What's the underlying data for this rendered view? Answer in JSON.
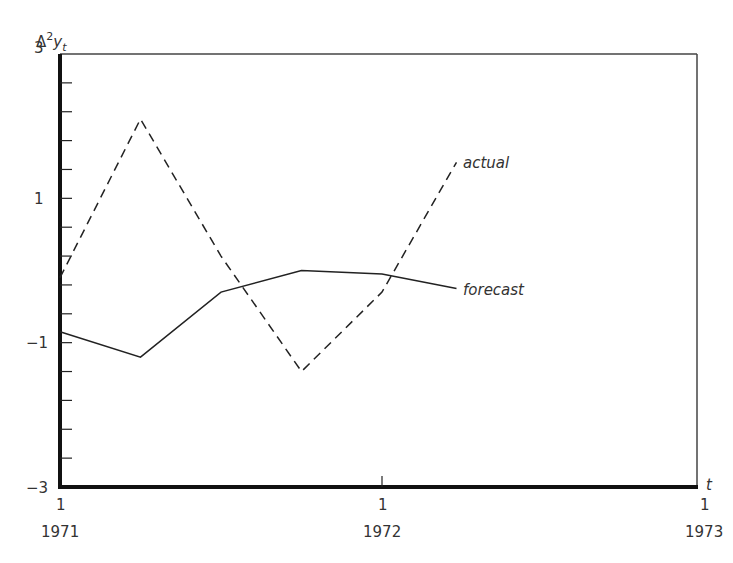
{
  "chart_data": {
    "type": "line",
    "title": "",
    "ylabel": "Δ²y_t",
    "xlabel": "t",
    "ylim": [
      -3,
      3
    ],
    "yticks_labeled": [
      "3",
      "1",
      "−1",
      "−3"
    ],
    "x_ticks": [
      {
        "quarter": "1",
        "year": "1971"
      },
      {
        "quarter": "1",
        "year": "1972"
      },
      {
        "quarter": "1",
        "year": "1973"
      }
    ],
    "x": [
      "1971Q1",
      "1971Q2",
      "1971Q3",
      "1971Q4",
      "1972Q1",
      "1972Q2"
    ],
    "series": [
      {
        "name": "actual",
        "style": "dashed",
        "values": [
          -0.1,
          2.1,
          0.2,
          -1.4,
          -0.3,
          1.5
        ]
      },
      {
        "name": "forecast",
        "style": "solid",
        "values": [
          -0.85,
          -1.2,
          -0.3,
          0.0,
          -0.05,
          -0.25
        ]
      }
    ],
    "grid": false,
    "legend": "inline labels at line ends"
  },
  "labels": {
    "y_axis": "Δ",
    "y_sup": "2",
    "y_var": "y",
    "y_sub": "t",
    "x_axis": "t",
    "series_actual": "actual",
    "series_forecast": "forecast"
  }
}
